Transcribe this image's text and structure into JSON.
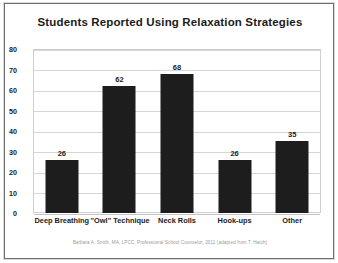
{
  "figure": {
    "footer_note": "Barbara A. Smith, MA, LPCC, Professional School Counselor, 2011 (adapted from T. Hatch)",
    "frame_color": "#6e6e6e",
    "background_color": "#ffffff"
  },
  "chart_data": {
    "type": "bar",
    "title": "Students Reported Using Relaxation Strategies",
    "xlabel": "",
    "ylabel": "",
    "categories": [
      "Deep Breathing",
      "\"Owl\" Technique",
      "Neck Rolls",
      "Hook-ups",
      "Other"
    ],
    "values": [
      26,
      62,
      68,
      26,
      35
    ],
    "data_labels": [
      "26",
      "62",
      "68",
      "26",
      "35"
    ],
    "ylim": [
      0,
      80
    ],
    "ytick_values": [
      80,
      70,
      60,
      50,
      40,
      30,
      20,
      10,
      0
    ],
    "ytick_labels": [
      "80",
      "70",
      "60",
      "50",
      "40",
      "30",
      "20",
      "10",
      "0"
    ],
    "grid": true,
    "grid_axis": "y",
    "grid_color": "#d6d6d6",
    "legend": false,
    "bar_color": "#1d1d1d",
    "plot_background": "#ffffff",
    "plot_border_color": "#cfcfcf",
    "text_color": "#1b1b1b"
  }
}
